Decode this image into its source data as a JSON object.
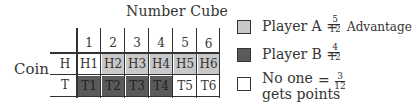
{
  "table": {
    "title": "Number Cube",
    "row_axis_label": "Coin",
    "column_headers": [
      "1",
      "2",
      "3",
      "4",
      "5",
      "6"
    ],
    "rows": [
      {
        "label": "H",
        "cells": [
          "H1",
          "H2",
          "H3",
          "H4",
          "H5",
          "H6"
        ],
        "shades": [
          "none",
          "light",
          "light",
          "light",
          "light",
          "light"
        ]
      },
      {
        "label": "T",
        "cells": [
          "T1",
          "T2",
          "T3",
          "T4",
          "T5",
          "T6"
        ],
        "shades": [
          "dark",
          "dark",
          "dark",
          "dark",
          "none",
          "none"
        ]
      }
    ]
  },
  "legend": {
    "items": [
      {
        "label": "Player A =",
        "num": "5",
        "den": "12",
        "note": "Advantage",
        "color": "#c8c8c8"
      },
      {
        "label": "Player B =",
        "num": "4",
        "den": "12",
        "color": "#5a5a5a"
      },
      {
        "label_line1": "No one",
        "eq": "=",
        "label_line2": "gets points",
        "num": "3",
        "den": "12",
        "color": "#ffffff"
      }
    ]
  },
  "colors": {
    "light": "#c8c8c8",
    "dark": "#5a5a5a",
    "none": "#ffffff",
    "line": "#333333"
  }
}
